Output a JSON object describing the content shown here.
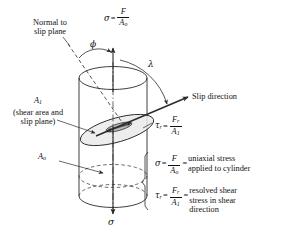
{
  "figure": {
    "background": "#ffffff",
    "line_color": "#2a2a2a",
    "slip_plane_fill": "#e8e8e8",
    "shear_sliver_fill": "#b9b9b9"
  },
  "labels": {
    "normal_line1": "Normal to",
    "normal_line2": "slip plane",
    "phi": "ϕ",
    "lambda": "λ",
    "slip_direction": "Slip direction",
    "area_shear": "A",
    "area_shear_sub": "1",
    "shear_note_line1": "(shear area and",
    "shear_note_line2": "slip plane)",
    "area_original": "A",
    "area_original_sub": "o",
    "sigma_bottom": "σ"
  },
  "equations": {
    "sigma_top": {
      "lhs": "σ",
      "eq": "=",
      "num": "F",
      "den": "A",
      "den_sub": "o"
    },
    "tau_plane": {
      "lhs": "τ",
      "lhs_sub": "r",
      "eq": "=",
      "num": "F",
      "num_sub": "r",
      "den": "A",
      "den_sub": "1"
    }
  },
  "legend": [
    {
      "lhs": "σ",
      "lhs_sub": "",
      "eq1": "=",
      "num": "F",
      "num_sub": "",
      "den": "A",
      "den_sub": "o",
      "eq2": "=",
      "desc_line1": "uniaxial stress",
      "desc_line2": "applied to cylinder",
      "desc_line3": ""
    },
    {
      "lhs": "τ",
      "lhs_sub": "r",
      "eq1": "=",
      "num": "F",
      "num_sub": "r",
      "den": "A",
      "den_sub": "1",
      "eq2": "=",
      "desc_line1": "resolved shear",
      "desc_line2": "stress in shear",
      "desc_line3": "direction"
    }
  ]
}
